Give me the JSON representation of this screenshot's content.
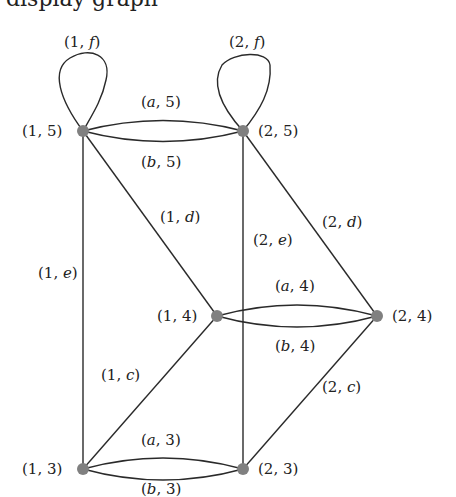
{
  "clipped_text_above": "display graph",
  "diagram": {
    "type": "graph",
    "nodes": [
      {
        "id": "n15",
        "label": "(1, 5)",
        "x": 83,
        "y": 131
      },
      {
        "id": "n25",
        "label": "(2, 5)",
        "x": 243,
        "y": 131
      },
      {
        "id": "n14",
        "label": "(1, 4)",
        "x": 217,
        "y": 316
      },
      {
        "id": "n24",
        "label": "(2, 4)",
        "x": 377,
        "y": 316
      },
      {
        "id": "n13",
        "label": "(1, 3)",
        "x": 83,
        "y": 469
      },
      {
        "id": "n23",
        "label": "(2, 3)",
        "x": 243,
        "y": 469
      }
    ],
    "edges": [
      {
        "from": "n15",
        "to": "n15",
        "label_pre": "(1, ",
        "label_var": "f",
        "label_post": ")",
        "kind": "loop"
      },
      {
        "from": "n25",
        "to": "n25",
        "label_pre": "(2, ",
        "label_var": "f",
        "label_post": ")",
        "kind": "loop"
      },
      {
        "from": "n15",
        "to": "n25",
        "label_pre": "(",
        "label_var": "a",
        "label_post": ", 5)",
        "kind": "arc-upper"
      },
      {
        "from": "n15",
        "to": "n25",
        "label_pre": "(",
        "label_var": "b",
        "label_post": ", 5)",
        "kind": "arc-lower"
      },
      {
        "from": "n14",
        "to": "n24",
        "label_pre": "(",
        "label_var": "a",
        "label_post": ", 4)",
        "kind": "arc-upper"
      },
      {
        "from": "n14",
        "to": "n24",
        "label_pre": "(",
        "label_var": "b",
        "label_post": ", 4)",
        "kind": "arc-lower"
      },
      {
        "from": "n13",
        "to": "n23",
        "label_pre": "(",
        "label_var": "a",
        "label_post": ", 3)",
        "kind": "arc-upper"
      },
      {
        "from": "n13",
        "to": "n23",
        "label_pre": "(",
        "label_var": "b",
        "label_post": ", 3)",
        "kind": "arc-lower"
      },
      {
        "from": "n15",
        "to": "n14",
        "label_pre": "(1, ",
        "label_var": "d",
        "label_post": ")",
        "kind": "line"
      },
      {
        "from": "n25",
        "to": "n24",
        "label_pre": "(2, ",
        "label_var": "d",
        "label_post": ")",
        "kind": "line"
      },
      {
        "from": "n15",
        "to": "n13",
        "label_pre": "(1, ",
        "label_var": "e",
        "label_post": ")",
        "kind": "line"
      },
      {
        "from": "n25",
        "to": "n23",
        "label_pre": "(2, ",
        "label_var": "e",
        "label_post": ")",
        "kind": "line"
      },
      {
        "from": "n14",
        "to": "n13",
        "label_pre": "(1, ",
        "label_var": "c",
        "label_post": ")",
        "kind": "line"
      },
      {
        "from": "n24",
        "to": "n23",
        "label_pre": "(2, ",
        "label_var": "c",
        "label_post": ")",
        "kind": "line"
      }
    ],
    "colors": {
      "node": "#808080",
      "edge": "#2a2a2a",
      "text": "#222222"
    }
  }
}
